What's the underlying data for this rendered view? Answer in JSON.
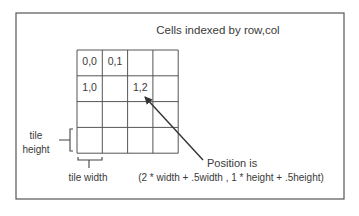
{
  "diagram": {
    "title": "Cells indexed by row,col",
    "grid": {
      "rows": 4,
      "cols": 4,
      "origin_x": 77,
      "origin_y": 50,
      "cell_width": 25.3,
      "cell_height": 25.8,
      "cells": [
        {
          "row": 0,
          "col": 0,
          "label": "0,0"
        },
        {
          "row": 0,
          "col": 1,
          "label": "0,1"
        },
        {
          "row": 1,
          "col": 0,
          "label": "1,0"
        },
        {
          "row": 1,
          "col": 2,
          "label": "1,2"
        }
      ]
    },
    "tile_height_label": [
      "tile",
      "height"
    ],
    "tile_width_label": "tile width",
    "annotation": {
      "line1": "Position is",
      "line2": "(2 * width + .5width , 1 * height + .5height)"
    },
    "colors": {
      "stroke": "#555555",
      "text": "#3a3a3a",
      "background": "#ffffff"
    }
  }
}
